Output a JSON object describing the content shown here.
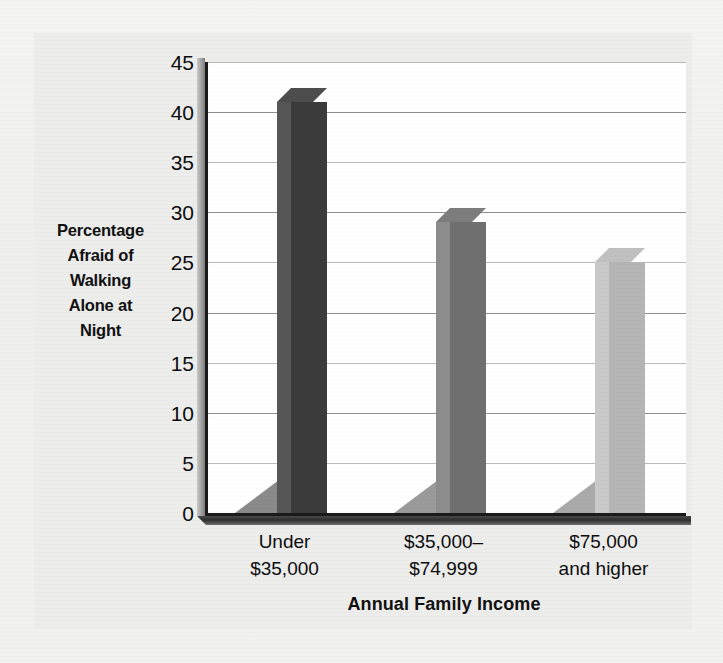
{
  "chart_data": {
    "type": "bar",
    "title": "",
    "categories": [
      "Under\n$35,000",
      "$35,000–\n$74,999",
      "$75,000\nand higher"
    ],
    "category_lines": [
      [
        "Under",
        "$35,000"
      ],
      [
        "$35,000–",
        "$74,999"
      ],
      [
        "$75,000",
        "and higher"
      ]
    ],
    "values": [
      41,
      29,
      25
    ],
    "xlabel": "Annual Family Income",
    "ylabel": "Percentage Afraid of Walking Alone at Night",
    "ylabel_lines": [
      "Percentage",
      "Afraid of",
      "Walking",
      "Alone at",
      "Night"
    ],
    "ylim": [
      0,
      45
    ],
    "yticks": [
      0,
      5,
      10,
      15,
      20,
      25,
      30,
      35,
      40,
      45
    ],
    "ytick_labels": [
      "0",
      "5",
      "10",
      "15",
      "20",
      "25",
      "30",
      "35",
      "40",
      "45"
    ],
    "grid": true,
    "legend": "none",
    "bar_colors": [
      "#3b3b3b",
      "#6f6f6f",
      "#b5b5b5"
    ],
    "bar_side_colors": [
      "#565656",
      "#8c8c8c",
      "#c9c9c9"
    ],
    "bar_top_colors": [
      "#4d4d4d",
      "#7d7d7d",
      "#c0c0c0"
    ],
    "shadow_colors": [
      "#8a8a8a",
      "#9a9a9a",
      "#a9a9a9"
    ]
  },
  "colors": {
    "page_background": "#f1f1ef",
    "figure_background": "#ececeb",
    "plot_background": "#ffffff",
    "axis": "#1b1b1b",
    "gridline": "#8f8f8f",
    "text": "#0d0d0d"
  }
}
